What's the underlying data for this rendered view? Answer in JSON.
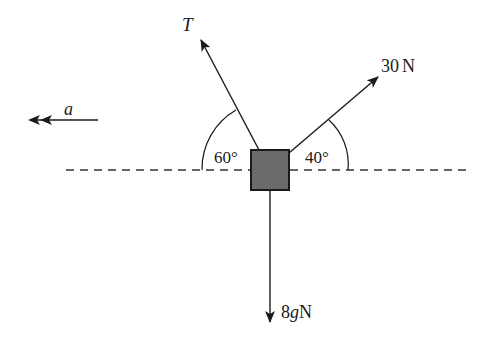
{
  "diagram": {
    "type": "free-body diagram",
    "block": {
      "color": "#6b6b6b",
      "border": "#1a1a1a"
    },
    "reference_line": {
      "style": "dashed",
      "orientation": "horizontal"
    },
    "forces": [
      {
        "id": "tension",
        "label": "T",
        "angle_label": "60°",
        "direction": "up-left",
        "angle_deg_from_horizontal": 60
      },
      {
        "id": "applied",
        "label_value": "30",
        "label_unit": "N",
        "angle_label": "40°",
        "direction": "up-right",
        "angle_deg_from_horizontal": 40
      },
      {
        "id": "weight",
        "label_value": "8",
        "label_var": "g",
        "label_unit": "N",
        "direction": "down"
      }
    ],
    "acceleration": {
      "label": "a",
      "direction": "left"
    }
  }
}
